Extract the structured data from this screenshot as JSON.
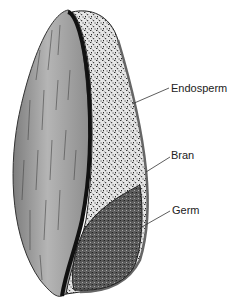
{
  "diagram": {
    "labels": [
      {
        "id": "endosperm",
        "text": "Endosperm",
        "x": 171,
        "y": 83
      },
      {
        "id": "bran",
        "text": "Bran",
        "x": 171,
        "y": 150
      },
      {
        "id": "germ",
        "text": "Germ",
        "x": 172,
        "y": 205
      }
    ],
    "colors": {
      "husk": "#9a9a9a",
      "husk_light": "#c4c4c4",
      "seam": "#111111",
      "endosperm": "#d8d8d8",
      "germ": "#555555",
      "leader": "#333333"
    }
  }
}
